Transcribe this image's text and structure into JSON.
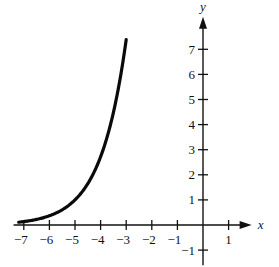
{
  "chart_data": {
    "type": "line",
    "title": "",
    "function": "y = e^(x+5)",
    "xlabel": "x",
    "ylabel": "y",
    "xlim": [
      -7.5,
      1.9
    ],
    "ylim": [
      -1.5,
      8.3
    ],
    "x_ticks": [
      -7,
      -6,
      -5,
      -4,
      -3,
      -2,
      -1,
      1
    ],
    "y_ticks": [
      -1,
      1,
      2,
      3,
      4,
      5,
      6,
      7
    ],
    "grid": false,
    "legend": null,
    "series": [
      {
        "name": "curve",
        "x": [
          -7.2,
          -7,
          -6.5,
          -6,
          -5.5,
          -5,
          -4.5,
          -4,
          -3.5,
          -3
        ],
        "y": [
          0.11,
          0.14,
          0.22,
          0.37,
          0.61,
          1.0,
          1.65,
          2.72,
          4.48,
          7.39
        ]
      }
    ],
    "colors": {
      "axis": "#111111",
      "curve": "#0a0a0a",
      "background": "#ffffff"
    }
  }
}
